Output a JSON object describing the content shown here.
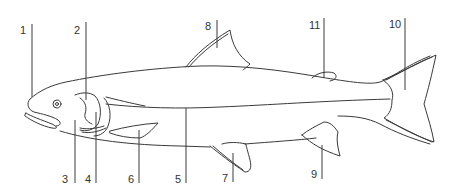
{
  "diagram": {
    "stroke_color": "#3a3a3a",
    "background": "#ffffff",
    "labels": [
      {
        "id": "1",
        "text": "1",
        "position": "top"
      },
      {
        "id": "2",
        "text": "2",
        "position": "top"
      },
      {
        "id": "3",
        "text": "3",
        "position": "bottom"
      },
      {
        "id": "4",
        "text": "4",
        "position": "bottom"
      },
      {
        "id": "5",
        "text": "5",
        "position": "bottom"
      },
      {
        "id": "6",
        "text": "6",
        "position": "bottom"
      },
      {
        "id": "7",
        "text": "7",
        "position": "bottom"
      },
      {
        "id": "8",
        "text": "8",
        "position": "top"
      },
      {
        "id": "9",
        "text": "9",
        "position": "bottom"
      },
      {
        "id": "10",
        "text": "10",
        "position": "top"
      },
      {
        "id": "11",
        "text": "11",
        "position": "top"
      }
    ]
  }
}
